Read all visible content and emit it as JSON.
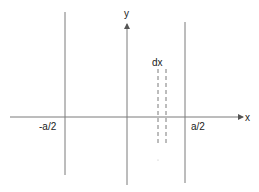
{
  "diagram": {
    "type": "coordinate-sketch",
    "axes": {
      "x_label": "x",
      "y_label": "y"
    },
    "labels": {
      "left_boundary": "-a/2",
      "right_boundary": "a/2",
      "strip": "dx"
    },
    "colors": {
      "line": "#7a7a7a",
      "text": "#222222",
      "background": "#ffffff"
    },
    "elements": [
      {
        "name": "left-boundary-line",
        "x": 65,
        "y1": 12,
        "y2": 175
      },
      {
        "name": "right-boundary-line",
        "x": 185,
        "y1": 22,
        "y2": 183
      },
      {
        "name": "y-axis",
        "x": 127,
        "y1": 185,
        "y2": 24,
        "arrow": "up"
      },
      {
        "name": "x-axis",
        "y": 117,
        "x1": 10,
        "x2": 243,
        "arrow": "right"
      },
      {
        "name": "strip-left-dashed",
        "x": 158,
        "y1": 69,
        "y2": 145,
        "style": "dashed"
      },
      {
        "name": "strip-right-dashed",
        "x": 166,
        "y1": 69,
        "y2": 145,
        "style": "dashed"
      }
    ]
  }
}
